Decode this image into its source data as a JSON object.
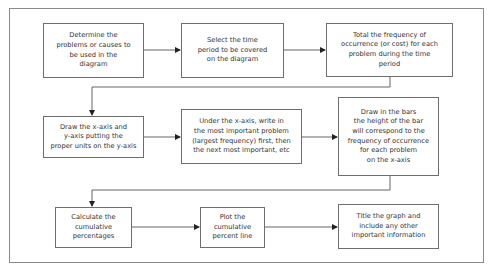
{
  "diagram": {
    "type": "flowchart",
    "steps": [
      {
        "id": 1,
        "text": "Determine the\nproblems or causes to\nbe used in the\ndiagram"
      },
      {
        "id": 2,
        "text": "Select the time\nperiod to be covered\non the diagram"
      },
      {
        "id": 3,
        "text": "Total the frequency of\noccurrence (or cost) for each\nproblem during the time\nperiod"
      },
      {
        "id": 4,
        "text": "Draw the x-axis and\ny-axis putting the\nproper units on the y-axis"
      },
      {
        "id": 5,
        "text": "Under the x-axis, write in\nthe most important problem\n(largest frequency) first, then\nthe next most important, etc"
      },
      {
        "id": 6,
        "text": "Draw in the bars\nthe height of the bar\nwill correspond to the\nfrequency of occurrence\nfor each problem\non the x-axis"
      },
      {
        "id": 7,
        "text": "Calculate the\ncumulative\npercentages"
      },
      {
        "id": 8,
        "text": "Plot the\ncumulative\npercent line"
      },
      {
        "id": 9,
        "text": "Title the graph and\ninclude any other\nimportant information"
      }
    ],
    "edges": [
      {
        "from": 1,
        "to": 2
      },
      {
        "from": 2,
        "to": 3
      },
      {
        "from": 3,
        "to": 4
      },
      {
        "from": 4,
        "to": 5
      },
      {
        "from": 5,
        "to": 6
      },
      {
        "from": 6,
        "to": 7
      },
      {
        "from": 7,
        "to": 8
      },
      {
        "from": 8,
        "to": 9
      }
    ],
    "colors": {
      "box_border": "#6e6e6e",
      "frame_border": "#8a8a8a",
      "text": "#333333",
      "connector": "#555555"
    }
  }
}
